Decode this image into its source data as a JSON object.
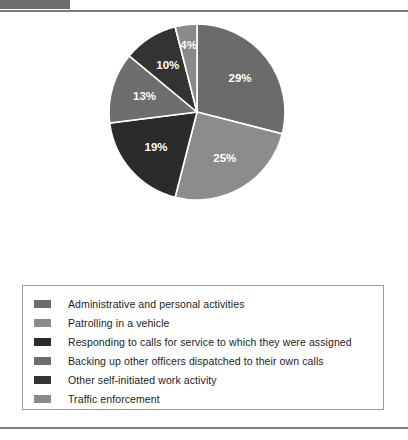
{
  "chart_data": {
    "type": "pie",
    "title": "",
    "labels": [
      "Administrative and personal activities",
      "Patrolling in a vehicle",
      "Responding to calls for service to which they were assigned",
      "Backing up other officers dispatched to their own calls",
      "Other self-initiated work activity",
      "Traffic enforcement"
    ],
    "values": [
      29,
      25,
      19,
      13,
      10,
      4
    ],
    "value_labels": [
      "29%",
      "25%",
      "19%",
      "13%",
      "10%",
      "4%"
    ],
    "unit": "percent",
    "colors": [
      "#6b6b6b",
      "#8c8c8c",
      "#2b2b2b",
      "#6e6e6e",
      "#333333",
      "#8a8a8a"
    ],
    "legend_position": "bottom",
    "start_angle_deg": 0,
    "direction": "clockwise",
    "grid": false,
    "xlabel": "",
    "ylabel": ""
  },
  "slices": [
    {
      "label": "29%",
      "value": 29,
      "color": "#6b6b6b",
      "lx": 242,
      "ly": 108
    },
    {
      "label": "25%",
      "value": 25,
      "color": "#8c8c8c",
      "lx": 218,
      "ly": 207
    },
    {
      "label": "19%",
      "value": 19,
      "color": "#2b2b2b",
      "lx": 152,
      "ly": 205
    },
    {
      "label": "13%",
      "value": 13,
      "color": "#6e6e6e",
      "lx": 127,
      "ly": 136
    },
    {
      "label": "10%",
      "value": 10,
      "color": "#333333",
      "lx": 158,
      "ly": 79
    },
    {
      "label": "4%",
      "value": 4,
      "color": "#8a8a8a",
      "lx": 193,
      "ly": 55
    }
  ],
  "legend": {
    "items": [
      {
        "label": "Administrative and personal activities",
        "color": "#6b6b6b"
      },
      {
        "label": "Patrolling in a vehicle",
        "color": "#8c8c8c"
      },
      {
        "label": "Responding to calls for service to which they were assigned",
        "color": "#2b2b2b"
      },
      {
        "label": "Backing up other officers dispatched to their own calls",
        "color": "#6e6e6e"
      },
      {
        "label": "Other self-initiated work activity",
        "color": "#333333"
      },
      {
        "label": "Traffic enforcement",
        "color": "#8a8a8a"
      }
    ]
  }
}
